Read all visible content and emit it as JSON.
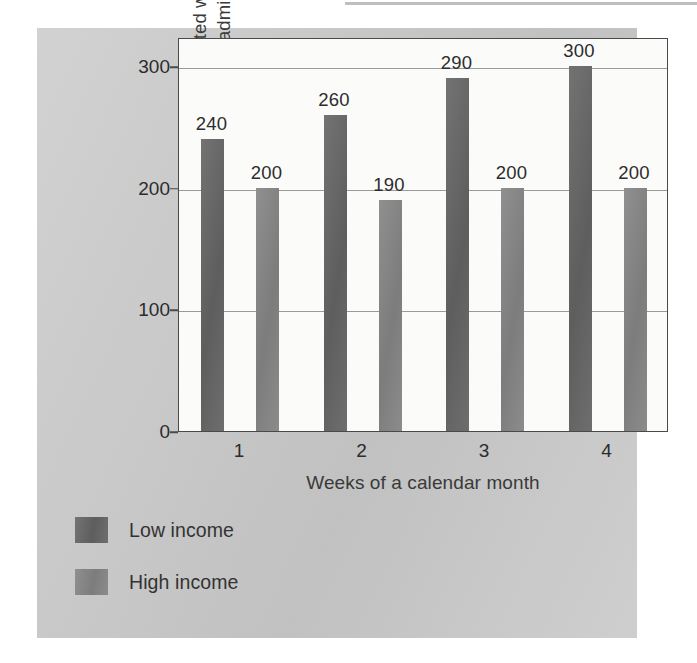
{
  "chart_data": {
    "type": "bar",
    "title": "",
    "subtitle": "",
    "xlabel": "Weeks of a calendar month",
    "ylabel": "Number of people admitted with hypoglycemia per 100,000 admissions",
    "ylabel_line1": "Number of people admitted with",
    "ylabel_line2": "hypoglycemia per 100,000 admissions",
    "categories": [
      "1",
      "2",
      "3",
      "4"
    ],
    "series": [
      {
        "name": "Low income",
        "color": "#636363",
        "values": [
          240,
          260,
          290,
          300
        ]
      },
      {
        "name": "High income",
        "color": "#838383",
        "values": [
          200,
          190,
          200,
          200
        ]
      }
    ],
    "ylim": [
      0,
      325
    ],
    "yticks": [
      0,
      100,
      200,
      300
    ],
    "ytick_labels": [
      "0",
      "100",
      "200",
      "300"
    ],
    "gridlines": [
      100,
      200,
      300
    ],
    "grid": true,
    "legend_position": "below-left",
    "value_labels_shown": true
  },
  "legend": {
    "items": [
      {
        "label": "Low income",
        "color": "#636363"
      },
      {
        "label": "High income",
        "color": "#838383"
      }
    ]
  },
  "colors": {
    "panel_background": "#c9c9c9",
    "plot_background": "#fbfbfa",
    "axis": "#4a4a4a",
    "gridline": "#9a9a9a",
    "low_income_bar": "#636363",
    "high_income_bar": "#838383",
    "text": "#2c2c2c",
    "page_background": "#ffffff"
  }
}
